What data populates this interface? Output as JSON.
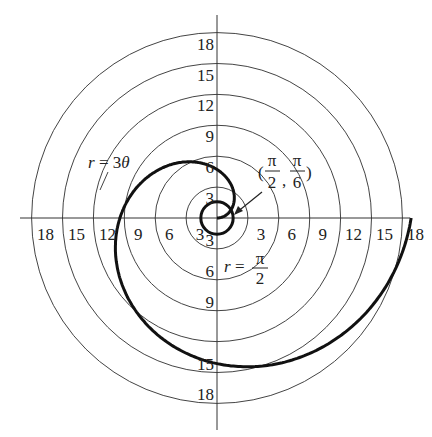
{
  "chart_data": {
    "type": "line",
    "subtype": "polar",
    "title": "",
    "center_px": [
      217,
      218
    ],
    "px_per_unit": 10.3,
    "rings": [
      3,
      6,
      9,
      12,
      15,
      18
    ],
    "axis_tick_labels": {
      "top": [
        "3",
        "6",
        "9",
        "12",
        "15",
        "18"
      ],
      "bottom": [
        "3",
        "6",
        "9",
        "15",
        "18"
      ],
      "left": [
        "3",
        "6",
        "9",
        "12",
        "15",
        "18"
      ],
      "right": [
        "3",
        "6",
        "9",
        "12",
        "15",
        "18"
      ]
    },
    "series": [
      {
        "name": "r = 3θ",
        "equation": "r = 3*theta",
        "theta_range": [
          0,
          6.2832
        ],
        "style": "bold"
      },
      {
        "name": "r = π/2",
        "equation": "r = pi/2",
        "style": "bold circle"
      }
    ],
    "annotations": [
      {
        "text": "r = 3θ",
        "position": "upper-left of spiral"
      },
      {
        "text": "r = π/2",
        "position": "below center"
      },
      {
        "text": "(π/2, π/6)",
        "position": "intersection point with arrow"
      }
    ],
    "grid": true,
    "legend": "none"
  }
}
